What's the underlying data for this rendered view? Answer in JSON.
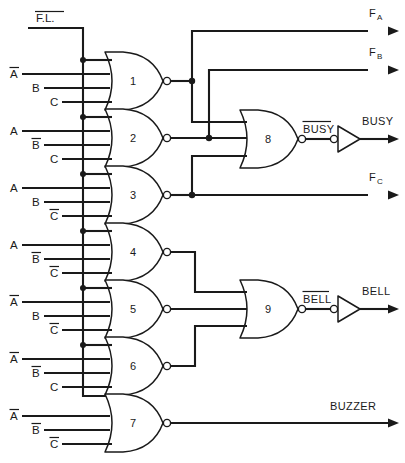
{
  "diagram": {
    "type": "logic-circuit-schematic",
    "background_color": "#ffffff",
    "line_color": "#1a1a1a"
  },
  "bus": {
    "label": "F.L.",
    "overbar": true,
    "name": "fault-latch-bus",
    "description": "Inverted F.L. enable line feeding the top input of every decode gate"
  },
  "gates": [
    {
      "number": "1",
      "type": "NOR",
      "inputs": [
        "F.L.",
        "A",
        "B",
        "C"
      ],
      "input_overbars": [
        true,
        true,
        false,
        false
      ],
      "output_label": "F_A"
    },
    {
      "number": "2",
      "type": "NOR",
      "inputs": [
        "F.L.",
        "A",
        "B",
        "C"
      ],
      "input_overbars": [
        true,
        false,
        true,
        false
      ],
      "output_label": "F_B"
    },
    {
      "number": "3",
      "type": "NOR",
      "inputs": [
        "F.L.",
        "A",
        "B",
        "C"
      ],
      "input_overbars": [
        true,
        false,
        false,
        true
      ],
      "output_label": "F_C"
    },
    {
      "number": "4",
      "type": "NOR",
      "inputs": [
        "F.L.",
        "A",
        "B",
        "C"
      ],
      "input_overbars": [
        true,
        false,
        true,
        true
      ],
      "output_label": ""
    },
    {
      "number": "5",
      "type": "NOR",
      "inputs": [
        "F.L.",
        "A",
        "B",
        "C"
      ],
      "input_overbars": [
        true,
        true,
        false,
        true
      ],
      "output_label": ""
    },
    {
      "number": "6",
      "type": "NOR",
      "inputs": [
        "F.L.",
        "A",
        "B",
        "C"
      ],
      "input_overbars": [
        true,
        true,
        true,
        false
      ],
      "output_label": ""
    },
    {
      "number": "7",
      "type": "NOR",
      "inputs": [
        "F.L.",
        "A",
        "B",
        "C"
      ],
      "input_overbars": [
        true,
        true,
        true,
        true
      ],
      "output_label": "BUZZER"
    },
    {
      "number": "8",
      "type": "NOR",
      "inputs": [
        "gate 1 output",
        "gate 2 output",
        "gate 3 output"
      ],
      "output_label": "BUSY"
    },
    {
      "number": "9",
      "type": "NOR",
      "inputs": [
        "gate 4 output",
        "gate 5 output",
        "gate 6 output"
      ],
      "output_label": "BELL"
    }
  ],
  "input_labels": {
    "row1": [
      {
        "text": "A",
        "overbar": true
      },
      {
        "text": "B",
        "overbar": false
      },
      {
        "text": "C",
        "overbar": false
      }
    ],
    "row2": [
      {
        "text": "A",
        "overbar": false
      },
      {
        "text": "B",
        "overbar": true
      },
      {
        "text": "C",
        "overbar": false
      }
    ],
    "row3": [
      {
        "text": "A",
        "overbar": false
      },
      {
        "text": "B",
        "overbar": false
      },
      {
        "text": "C",
        "overbar": true
      }
    ],
    "row4": [
      {
        "text": "A",
        "overbar": false
      },
      {
        "text": "B",
        "overbar": true
      },
      {
        "text": "C",
        "overbar": true
      }
    ],
    "row5": [
      {
        "text": "A",
        "overbar": true
      },
      {
        "text": "B",
        "overbar": false
      },
      {
        "text": "C",
        "overbar": true
      }
    ],
    "row6": [
      {
        "text": "A",
        "overbar": true
      },
      {
        "text": "B",
        "overbar": true
      },
      {
        "text": "C",
        "overbar": false
      }
    ],
    "row7": [
      {
        "text": "A",
        "overbar": true
      },
      {
        "text": "B",
        "overbar": true
      },
      {
        "text": "C",
        "overbar": true
      }
    ]
  },
  "outputs": [
    {
      "name": "F_A",
      "base": "F",
      "subscript": "A",
      "overbar": false
    },
    {
      "name": "F_B",
      "base": "F",
      "subscript": "B",
      "overbar": false
    },
    {
      "name": "F_C",
      "base": "F",
      "subscript": "C",
      "overbar": false
    },
    {
      "name": "BUSY",
      "base": "BUSY",
      "subscript": "",
      "overbar": false
    },
    {
      "name": "BELL",
      "base": "BELL",
      "subscript": "",
      "overbar": false
    },
    {
      "name": "BUZZER",
      "base": "BUZZER",
      "subscript": "",
      "overbar": false
    }
  ],
  "intermediate_labels": [
    {
      "text": "BUSY",
      "overbar": true,
      "from_gate": "8"
    },
    {
      "text": "BELL",
      "overbar": true,
      "from_gate": "9"
    }
  ],
  "inverters": [
    {
      "name": "busy-inverter",
      "input_label": "BUSY",
      "input_overbar": true,
      "output_label": "BUSY",
      "bubble_side": "input"
    },
    {
      "name": "bell-inverter",
      "input_label": "BELL",
      "input_overbar": true,
      "output_label": "BELL",
      "bubble_side": "input"
    }
  ],
  "letters": {
    "A": "A",
    "B": "B",
    "C": "C"
  },
  "gate_numbers": [
    "1",
    "2",
    "3",
    "4",
    "5",
    "6",
    "7",
    "8",
    "9"
  ]
}
